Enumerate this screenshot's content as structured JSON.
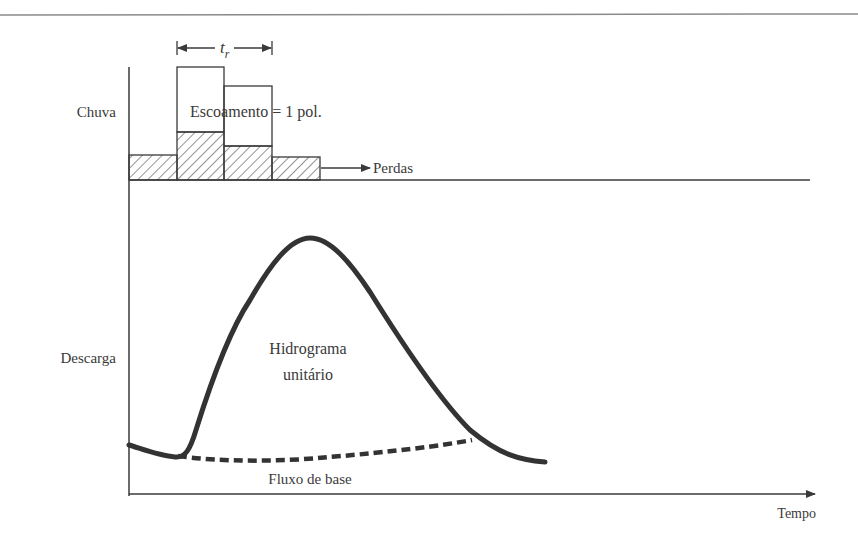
{
  "diagram": {
    "type": "unit-hydrograph-schematic",
    "labels": {
      "rain_axis": "Chuva",
      "discharge_axis": "Descarga",
      "time_axis": "Tempo",
      "runoff": "Escoamento = 1 pol.",
      "losses": "Perdas",
      "hydrograph_line1": "Hidrograma",
      "hydrograph_line2": "unitário",
      "baseflow": "Fluxo de base",
      "duration_symbol": "t",
      "duration_subscript": "r"
    },
    "hyetograph": {
      "blocks": [
        {
          "x0": 129,
          "x1": 177,
          "total_top": 155,
          "loss_top": 155
        },
        {
          "x0": 177,
          "x1": 224,
          "total_top": 67,
          "loss_top": 132
        },
        {
          "x0": 224,
          "x1": 272,
          "total_top": 86,
          "loss_top": 146
        },
        {
          "x0": 272,
          "x1": 320,
          "total_top": 157,
          "loss_top": 157
        }
      ],
      "baseline_y": 180
    },
    "colors": {
      "ink": "#3a3a3a",
      "curve": "#333333",
      "rule": "#8a8a8a"
    }
  }
}
